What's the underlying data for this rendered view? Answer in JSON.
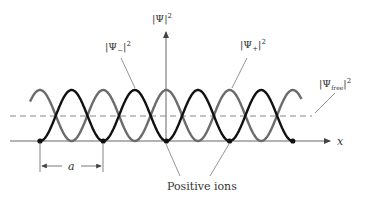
{
  "diagram": {
    "labels": {
      "psi_total": "|Ψ|",
      "psi_total_exp": "2",
      "psi_minus": "|Ψ",
      "psi_minus_sub": "−",
      "psi_minus_close": "|",
      "psi_minus_exp": "2",
      "psi_plus": "|Ψ",
      "psi_plus_sub": "+",
      "psi_plus_close": "|",
      "psi_plus_exp": "2",
      "psi_free": "|Ψ",
      "psi_free_sub": "free",
      "psi_free_close": "|",
      "psi_free_exp": "2",
      "x_axis": "x",
      "spacing": "a",
      "ions": "Positive ions"
    },
    "curves": [
      {
        "name": "psi-plus-squared",
        "form": "cos^2",
        "color": "#6b6b6b",
        "periods": 4.3
      },
      {
        "name": "psi-minus-squared",
        "form": "sin^2",
        "color": "#111111",
        "periods": 4
      }
    ],
    "free_level": 0.5,
    "ion_count": 5,
    "colors": {
      "axis": "#555555",
      "dashed": "#777777",
      "ion": "#111111"
    }
  }
}
